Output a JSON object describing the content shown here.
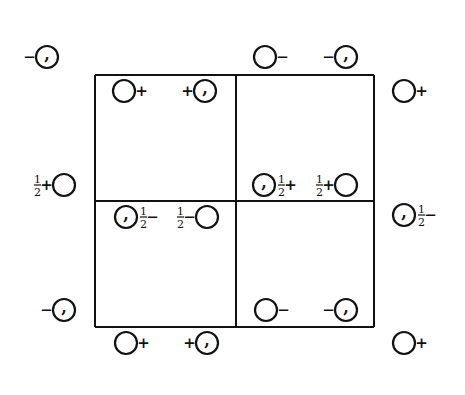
{
  "figure": {
    "type": "space-group symmetry diagram (unit cell, general positions)",
    "grid": {
      "x_lines": [
        95,
        236,
        374
      ],
      "y_lines": [
        75,
        201,
        327
      ],
      "stroke": "#111111"
    },
    "symbols": [
      {
        "id": "p1",
        "x": 47,
        "y": 57,
        "comma": true,
        "pre": "−",
        "post": ""
      },
      {
        "id": "p2",
        "x": 265,
        "y": 57,
        "comma": false,
        "pre": "",
        "post": "−"
      },
      {
        "id": "p3",
        "x": 346,
        "y": 57,
        "comma": true,
        "pre": "−",
        "post": ""
      },
      {
        "id": "p4",
        "x": 124,
        "y": 91,
        "comma": false,
        "pre": "",
        "post": "+"
      },
      {
        "id": "p5",
        "x": 205,
        "y": 91,
        "comma": true,
        "pre": "+",
        "post": ""
      },
      {
        "id": "p6",
        "x": 404,
        "y": 91,
        "comma": false,
        "pre": "",
        "post": "+"
      },
      {
        "id": "p7",
        "x": 64,
        "y": 185,
        "comma": false,
        "pre": "½+",
        "post": ""
      },
      {
        "id": "p8",
        "x": 264,
        "y": 185,
        "comma": true,
        "pre": "",
        "post": "½+"
      },
      {
        "id": "p9",
        "x": 346,
        "y": 185,
        "comma": false,
        "pre": "½+",
        "post": ""
      },
      {
        "id": "p10",
        "x": 126,
        "y": 217,
        "comma": true,
        "pre": "",
        "post": "½−"
      },
      {
        "id": "p11",
        "x": 207,
        "y": 217,
        "comma": false,
        "pre": "½−",
        "post": ""
      },
      {
        "id": "p12",
        "x": 404,
        "y": 215,
        "comma": true,
        "pre": "",
        "post": "½−"
      },
      {
        "id": "p13",
        "x": 64,
        "y": 310,
        "comma": true,
        "pre": "−",
        "post": ""
      },
      {
        "id": "p14",
        "x": 266,
        "y": 310,
        "comma": false,
        "pre": "",
        "post": "−"
      },
      {
        "id": "p15",
        "x": 346,
        "y": 310,
        "comma": true,
        "pre": "−",
        "post": ""
      },
      {
        "id": "p16",
        "x": 126,
        "y": 343,
        "comma": false,
        "pre": "",
        "post": "+"
      },
      {
        "id": "p17",
        "x": 207,
        "y": 343,
        "comma": true,
        "pre": "+",
        "post": ""
      },
      {
        "id": "p18",
        "x": 404,
        "y": 343,
        "comma": false,
        "pre": "",
        "post": "+"
      }
    ]
  }
}
